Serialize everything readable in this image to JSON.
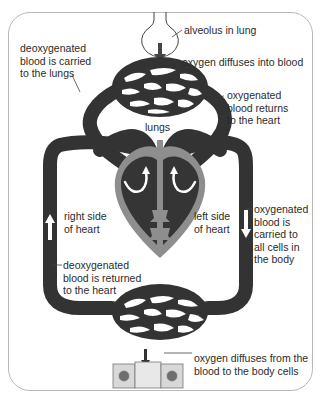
{
  "diagram": {
    "colors": {
      "vessel": "#333333",
      "heart_outline": "#8e8e8e",
      "heart_chamber": "#353535",
      "frame_border": "#b9b9b9",
      "arrow": "#ffffff",
      "cell_fill": "#dadada",
      "nucleus": "#6e6e6e"
    },
    "labels": {
      "alveolus": "alveolus in lung",
      "oxygen_into_blood": "oxygen diffuses into blood",
      "deoxygenated_to_lungs": "deoxygenated\nblood is carried\nto the lungs",
      "oxygenated_returns": "oxygenated\nblood returns\nto the heart",
      "lungs": "lungs",
      "right_side": "right side\nof heart",
      "left_side": "left side\nof heart",
      "oxygenated_to_cells": "oxygenated\nblood is\ncarried to\nall cells in\nthe body",
      "deoxygenated_returned": "deoxygenated\nblood is returned\nto the heart",
      "oxygen_to_cells": "oxygen diffuses from the\nblood to the body cells"
    },
    "components": [
      "alveolus",
      "lung capillaries",
      "heart",
      "body capillaries",
      "body cells"
    ]
  }
}
